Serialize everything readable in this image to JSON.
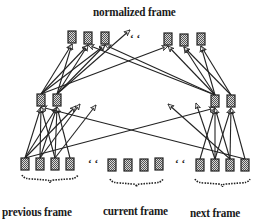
{
  "diagram": {
    "type": "neural-network-frame-normalization",
    "labels": {
      "top": "normalized frame",
      "previous": "previous frame",
      "current": "current frame",
      "next": "next frame"
    },
    "colors": {
      "node_fill": "#9a9a9a",
      "node_stroke": "#222222",
      "edge": "#222222",
      "text": "#1a1a1a"
    },
    "layers": {
      "output": {
        "name": "normalized frame",
        "nodes": [
          {
            "id": "o1",
            "x": 68,
            "y": 31
          },
          {
            "id": "o2",
            "x": 84,
            "y": 32
          },
          {
            "id": "o3",
            "x": 101,
            "y": 32
          },
          {
            "id": "o4",
            "x": 164,
            "y": 33
          },
          {
            "id": "o5",
            "x": 180,
            "y": 34
          },
          {
            "id": "o6",
            "x": 197,
            "y": 33
          }
        ],
        "ellipsis": {
          "x": 130,
          "y": 36
        }
      },
      "hidden": {
        "nodes": [
          {
            "id": "h1",
            "x": 37,
            "y": 94
          },
          {
            "id": "h2",
            "x": 53,
            "y": 94
          },
          {
            "id": "h3",
            "x": 211,
            "y": 95
          },
          {
            "id": "h4",
            "x": 227,
            "y": 95
          }
        ]
      },
      "input": {
        "groups": [
          {
            "name": "previous frame",
            "nodes": [
              {
                "id": "p1",
                "x": 21,
                "y": 158
              },
              {
                "id": "p2",
                "x": 36,
                "y": 158
              },
              {
                "id": "p3",
                "x": 51,
                "y": 158
              },
              {
                "id": "p4",
                "x": 66,
                "y": 158
              }
            ]
          },
          {
            "name": "current frame",
            "nodes": [
              {
                "id": "c1",
                "x": 108,
                "y": 159
              },
              {
                "id": "c2",
                "x": 124,
                "y": 159
              },
              {
                "id": "c3",
                "x": 140,
                "y": 159
              },
              {
                "id": "c4",
                "x": 155,
                "y": 158
              }
            ]
          },
          {
            "name": "next frame",
            "nodes": [
              {
                "id": "n1",
                "x": 196,
                "y": 159
              },
              {
                "id": "n2",
                "x": 211,
                "y": 159
              },
              {
                "id": "n3",
                "x": 226,
                "y": 159
              },
              {
                "id": "n4",
                "x": 241,
                "y": 159
              }
            ]
          }
        ],
        "ellipses": [
          {
            "x": 88,
            "y": 163
          },
          {
            "x": 175,
            "y": 163
          }
        ]
      }
    },
    "edges_hidden_to_output": [
      [
        "h1",
        "o1"
      ],
      [
        "h1",
        "o2"
      ],
      [
        "h2",
        "o1"
      ],
      [
        "h2",
        "o2"
      ],
      [
        "h2",
        "o3"
      ],
      [
        "h1",
        "o3"
      ],
      [
        "h2",
        "ellipsis"
      ],
      [
        "h3",
        "o4"
      ],
      [
        "h3",
        "o5"
      ],
      [
        "h4",
        "o5"
      ],
      [
        "h4",
        "o6"
      ],
      [
        "h3",
        "o6"
      ],
      [
        "h3",
        "o3"
      ],
      [
        "h3",
        "o2"
      ],
      [
        "h1",
        "o4"
      ]
    ],
    "edges_input_to_hidden": [
      [
        "p1",
        "h1"
      ],
      [
        "p1",
        "h2"
      ],
      [
        "p2",
        "h1"
      ],
      [
        "p2",
        "h2"
      ],
      [
        "p3",
        "h1"
      ],
      [
        "p3",
        "h2"
      ],
      [
        "p4",
        "h2"
      ],
      [
        "p1",
        "h3"
      ],
      [
        "p1",
        "mid_l1"
      ],
      [
        "p2",
        "mid_l2"
      ],
      [
        "p3",
        "mid_l3"
      ],
      [
        "n1",
        "h3"
      ],
      [
        "n2",
        "h3"
      ],
      [
        "n2",
        "h4"
      ],
      [
        "n3",
        "h3"
      ],
      [
        "n3",
        "h4"
      ],
      [
        "n4",
        "h4"
      ],
      [
        "n4",
        "h1"
      ],
      [
        "n3",
        "mid_r1"
      ],
      [
        "n2",
        "mid_r2"
      ]
    ],
    "braces": [
      {
        "group": "previous frame",
        "x1": 22,
        "x2": 78,
        "y": 177
      },
      {
        "group": "current frame",
        "x1": 110,
        "x2": 163,
        "y": 181
      },
      {
        "group": "next frame",
        "x1": 195,
        "x2": 250,
        "y": 181
      }
    ]
  }
}
